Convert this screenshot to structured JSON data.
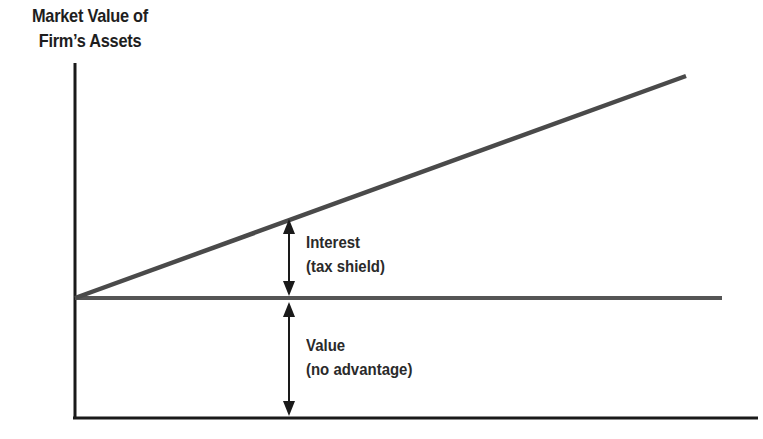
{
  "diagram": {
    "y_axis_label": {
      "line1": "Market Value of",
      "line2": "Firm’s Assets"
    },
    "x_axis_label": "",
    "lines": [
      {
        "name": "levered-firm-value",
        "description": "Sloped line rising from origin",
        "from": [
          75,
          298
        ],
        "to": [
          686,
          76
        ],
        "color": "#4a4a4a"
      },
      {
        "name": "unlevered-firm-value",
        "description": "Horizontal line",
        "from": [
          75,
          298
        ],
        "to": [
          722,
          298
        ],
        "color": "#555555"
      }
    ],
    "annotations": [
      {
        "line1": "Interest",
        "line2": "(tax shield)"
      },
      {
        "line1": "Value",
        "line2": "(no advantage)"
      }
    ],
    "colors": {
      "axis": "#1a1a1a",
      "sloped_line": "#4a4a4a",
      "flat_line": "#555555",
      "text": "#2a2a2a"
    }
  }
}
